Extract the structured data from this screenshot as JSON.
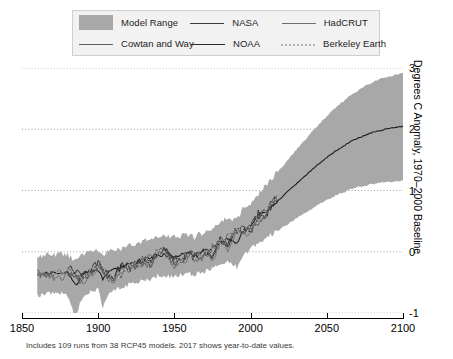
{
  "legend": {
    "rows": [
      [
        {
          "key": "model_range",
          "label": "Model Range",
          "sample": "swatch",
          "color": "#a8a8a8"
        },
        {
          "key": "nasa",
          "label": "NASA",
          "sample": "line",
          "color": "#3c3c3c"
        },
        {
          "key": "hadcrut",
          "label": "HadCRUT",
          "sample": "line",
          "color": "#6e6e6e"
        }
      ],
      [
        {
          "key": "cowtan_and_way",
          "label": "Cowtan and Way",
          "sample": "line",
          "color": "#5b5b5b"
        },
        {
          "key": "noaa",
          "label": "NOAA",
          "sample": "line",
          "color": "#2b2b2b"
        },
        {
          "key": "berkeley_earth",
          "label": "Berkeley Earth",
          "sample": "line-dotted",
          "color": "#b4b4b4"
        }
      ]
    ]
  },
  "axes": {
    "y_title": "Degrees C Anomaly, 1970–2000 Baseline",
    "x_ticks": [
      "1850",
      "1900",
      "1950",
      "2000",
      "2050",
      "2100"
    ],
    "y_ticks": [
      "3",
      "2",
      "1",
      "0",
      "-1"
    ]
  },
  "caption": "Includes 109 runs from 38 RCP45 models. 2017 shows year-to-date values.",
  "chart_data": {
    "type": "line",
    "title": "",
    "xlabel": "",
    "ylabel": "Degrees C Anomaly, 1970–2000 Baseline",
    "xlim": [
      1850,
      2100
    ],
    "ylim": [
      -1,
      3
    ],
    "grid": true,
    "grid_style": "dotted",
    "legend_position": "top",
    "xticks": [
      1850,
      1900,
      1950,
      2000,
      2050,
      2100
    ],
    "yticks": [
      -1,
      0,
      1,
      2,
      3
    ],
    "band": {
      "name": "Model Range",
      "fill": "#a8a8a8",
      "x": [
        1860,
        1865,
        1870,
        1875,
        1880,
        1883,
        1885,
        1890,
        1895,
        1900,
        1903,
        1905,
        1910,
        1915,
        1920,
        1925,
        1930,
        1935,
        1940,
        1945,
        1950,
        1955,
        1960,
        1963,
        1965,
        1970,
        1975,
        1980,
        1985,
        1991,
        1995,
        2000,
        2005,
        2010,
        2015,
        2017,
        2020,
        2025,
        2030,
        2035,
        2040,
        2045,
        2050,
        2055,
        2060,
        2065,
        2070,
        2075,
        2080,
        2085,
        2090,
        2095,
        2100
      ],
      "upper": [
        -0.1,
        -0.06,
        -0.05,
        -0.04,
        -0.05,
        -0.1,
        -0.12,
        -0.04,
        0.0,
        0.0,
        -0.06,
        -0.02,
        0.02,
        0.05,
        0.1,
        0.13,
        0.18,
        0.2,
        0.26,
        0.24,
        0.24,
        0.26,
        0.28,
        0.22,
        0.28,
        0.32,
        0.38,
        0.48,
        0.56,
        0.52,
        0.7,
        0.8,
        0.94,
        1.08,
        1.22,
        1.28,
        1.36,
        1.52,
        1.66,
        1.8,
        1.95,
        2.08,
        2.22,
        2.34,
        2.44,
        2.54,
        2.62,
        2.7,
        2.77,
        2.82,
        2.86,
        2.89,
        2.92
      ],
      "lower": [
        -0.72,
        -0.7,
        -0.68,
        -0.68,
        -0.7,
        -0.95,
        -1.05,
        -0.72,
        -0.66,
        -0.62,
        -0.92,
        -0.78,
        -0.6,
        -0.58,
        -0.54,
        -0.5,
        -0.46,
        -0.44,
        -0.38,
        -0.4,
        -0.4,
        -0.38,
        -0.36,
        -0.42,
        -0.36,
        -0.32,
        -0.28,
        -0.2,
        -0.14,
        -0.26,
        -0.04,
        0.04,
        0.14,
        0.22,
        0.3,
        0.33,
        0.38,
        0.46,
        0.54,
        0.62,
        0.7,
        0.78,
        0.85,
        0.91,
        0.96,
        1.01,
        1.05,
        1.08,
        1.11,
        1.13,
        1.14,
        1.15,
        1.16
      ],
      "center": [
        -0.38,
        -0.36,
        -0.35,
        -0.34,
        -0.35,
        -0.48,
        -0.55,
        -0.36,
        -0.32,
        -0.3,
        -0.45,
        -0.38,
        -0.28,
        -0.25,
        -0.21,
        -0.17,
        -0.13,
        -0.11,
        -0.05,
        -0.07,
        -0.07,
        -0.05,
        -0.03,
        -0.09,
        -0.03,
        0.01,
        0.06,
        0.15,
        0.22,
        0.14,
        0.34,
        0.43,
        0.55,
        0.66,
        0.77,
        0.81,
        0.88,
        1.0,
        1.11,
        1.22,
        1.33,
        1.44,
        1.54,
        1.63,
        1.71,
        1.79,
        1.85,
        1.9,
        1.95,
        1.98,
        2.01,
        2.03,
        2.05
      ]
    },
    "series": [
      {
        "name": "NASA",
        "color": "#3c3c3c",
        "x": [
          1880,
          1885,
          1890,
          1895,
          1900,
          1905,
          1910,
          1915,
          1920,
          1925,
          1930,
          1935,
          1940,
          1945,
          1950,
          1955,
          1960,
          1965,
          1970,
          1975,
          1980,
          1985,
          1990,
          1995,
          2000,
          2005,
          2010,
          2015,
          2017
        ],
        "y": [
          -0.3,
          -0.38,
          -0.42,
          -0.32,
          -0.22,
          -0.36,
          -0.44,
          -0.26,
          -0.28,
          -0.22,
          -0.16,
          -0.2,
          0.02,
          0.0,
          -0.18,
          -0.14,
          -0.04,
          -0.12,
          0.0,
          -0.08,
          0.18,
          0.1,
          0.36,
          0.36,
          0.38,
          0.62,
          0.64,
          0.84,
          0.9
        ]
      },
      {
        "name": "NOAA",
        "color": "#2b2b2b",
        "x": [
          1880,
          1885,
          1890,
          1895,
          1900,
          1905,
          1910,
          1915,
          1920,
          1925,
          1930,
          1935,
          1940,
          1945,
          1950,
          1955,
          1960,
          1965,
          1970,
          1975,
          1980,
          1985,
          1990,
          1995,
          2000,
          2005,
          2010,
          2015,
          2017
        ],
        "y": [
          -0.26,
          -0.34,
          -0.4,
          -0.3,
          -0.18,
          -0.32,
          -0.42,
          -0.22,
          -0.24,
          -0.18,
          -0.12,
          -0.18,
          0.06,
          0.02,
          -0.14,
          -0.12,
          -0.02,
          -0.1,
          0.02,
          -0.06,
          0.2,
          0.12,
          0.38,
          0.34,
          0.36,
          0.58,
          0.6,
          0.82,
          0.88
        ]
      },
      {
        "name": "HadCRUT",
        "color": "#6e6e6e",
        "x": [
          1860,
          1865,
          1870,
          1875,
          1880,
          1885,
          1890,
          1895,
          1900,
          1905,
          1910,
          1915,
          1920,
          1925,
          1930,
          1935,
          1940,
          1945,
          1950,
          1955,
          1960,
          1965,
          1970,
          1975,
          1980,
          1985,
          1990,
          1995,
          2000,
          2005,
          2010,
          2015,
          2017
        ],
        "y": [
          -0.36,
          -0.38,
          -0.4,
          -0.44,
          -0.34,
          -0.44,
          -0.48,
          -0.36,
          -0.24,
          -0.4,
          -0.48,
          -0.28,
          -0.3,
          -0.26,
          -0.18,
          -0.22,
          0.0,
          -0.04,
          -0.22,
          -0.18,
          -0.08,
          -0.16,
          -0.04,
          -0.12,
          0.14,
          0.06,
          0.32,
          0.3,
          0.32,
          0.56,
          0.58,
          0.78,
          0.84
        ]
      },
      {
        "name": "Cowtan and Way",
        "color": "#5b5b5b",
        "x": [
          1860,
          1870,
          1880,
          1890,
          1900,
          1910,
          1920,
          1930,
          1940,
          1950,
          1960,
          1970,
          1980,
          1990,
          2000,
          2010,
          2017
        ],
        "y": [
          -0.34,
          -0.38,
          -0.32,
          -0.46,
          -0.22,
          -0.46,
          -0.28,
          -0.16,
          0.02,
          -0.2,
          -0.06,
          -0.02,
          0.16,
          0.34,
          0.36,
          0.62,
          0.92
        ]
      },
      {
        "name": "Berkeley Earth",
        "color": "#b4b4b4",
        "x": [
          1860,
          1870,
          1880,
          1890,
          1900,
          1910,
          1920,
          1930,
          1940,
          1950,
          1960,
          1970,
          1980,
          1990,
          2000,
          2010,
          2017
        ],
        "y": [
          -0.38,
          -0.42,
          -0.3,
          -0.44,
          -0.2,
          -0.44,
          -0.26,
          -0.14,
          0.04,
          -0.18,
          -0.04,
          0.0,
          0.18,
          0.36,
          0.38,
          0.64,
          0.94
        ]
      }
    ]
  }
}
